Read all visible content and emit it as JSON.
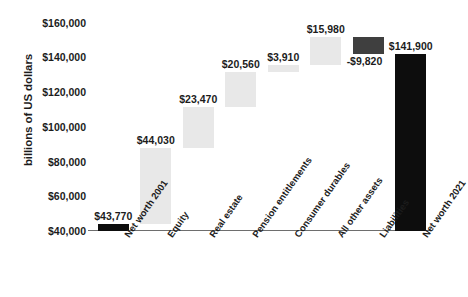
{
  "chart_data": {
    "type": "bar",
    "subtype": "waterfall",
    "title": "",
    "subtitle": "",
    "xlabel": "",
    "ylabel": "billions of US dollars",
    "ylim": [
      40000,
      165000
    ],
    "ytick_values": [
      40000,
      60000,
      80000,
      100000,
      120000,
      140000,
      160000
    ],
    "ytick_labels": [
      "$40,000",
      "$60,000",
      "$80,000",
      "$100,000",
      "$120,000",
      "$140,000",
      "$160,000"
    ],
    "grid": false,
    "legend": "none",
    "categories": [
      "Net worth 2001",
      "Equity",
      "Real estate",
      "Pension entitlements",
      "Consumer durables",
      "All other assets",
      "Liabilities",
      "Net worth 2021"
    ],
    "values": [
      43770,
      44030,
      23470,
      20560,
      3910,
      15980,
      -9820,
      141900
    ],
    "data_labels": [
      "$43,770",
      "$44,030",
      "$23,470",
      "$20,560",
      "$3,910",
      "$15,980",
      "-$9,820",
      "$141,900"
    ],
    "bar_kinds": [
      "total",
      "increase",
      "increase",
      "increase",
      "increase",
      "increase",
      "decrease",
      "total"
    ],
    "cumulative_base": [
      0,
      43770,
      87800,
      111270,
      131830,
      135740,
      151720,
      0
    ],
    "cumulative_top": [
      43770,
      87800,
      111270,
      131830,
      135740,
      151720,
      141900,
      141900
    ],
    "colors": {
      "total": "#0d0d0d",
      "increase": "#e8e8e8",
      "decrease": "#3f3f3f",
      "axis": "#6e6e6e",
      "text": "#1c1c1c",
      "background": "#ffffff"
    }
  }
}
